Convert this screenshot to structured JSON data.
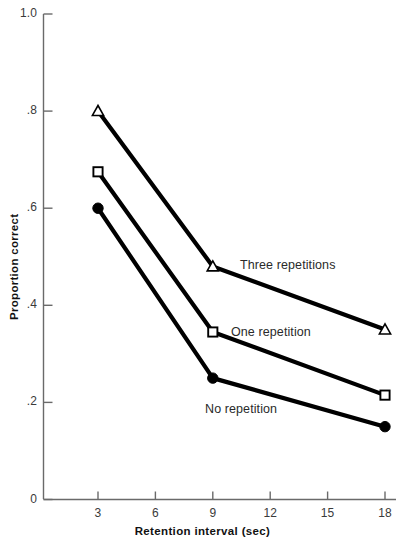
{
  "chart_data": {
    "type": "line",
    "title": "",
    "xlabel": "Retention interval (sec)",
    "ylabel": "Proportion correct",
    "x": [
      3,
      9,
      18
    ],
    "xlim": [
      1.2,
      19.2
    ],
    "ylim": [
      0,
      1.0
    ],
    "grid": false,
    "legend_position": "inline-right-of-series",
    "xticks": [
      "3",
      "6",
      "9",
      "12",
      "15",
      "18"
    ],
    "xtick_values": [
      3,
      6,
      9,
      12,
      15,
      18
    ],
    "yticks": [
      "0",
      ".2",
      ".4",
      ".6",
      ".8",
      "1.0"
    ],
    "ytick_values": [
      0,
      0.2,
      0.4,
      0.6,
      0.8,
      1.0
    ],
    "series": [
      {
        "name": "Three repetitions",
        "marker": "open-triangle",
        "values": [
          0.8,
          0.48,
          0.35
        ],
        "label_text": "Three repetitions"
      },
      {
        "name": "One repetition",
        "marker": "open-square",
        "values": [
          0.675,
          0.345,
          0.215
        ],
        "label_text": "One repetition"
      },
      {
        "name": "No repetition",
        "marker": "filled-circle",
        "values": [
          0.6,
          0.25,
          0.15
        ],
        "label_text": "No repetition"
      }
    ],
    "colors": {
      "line": "#000000",
      "marker_fill_open": "#ffffff",
      "marker_stroke": "#000000",
      "axis": "#555555",
      "text": "#1a1a1a",
      "background": "#ffffff"
    }
  },
  "annotations": {
    "three_repetitions": "Three repetitions",
    "one_repetition": "One repetition",
    "no_repetition": "No repetition"
  }
}
